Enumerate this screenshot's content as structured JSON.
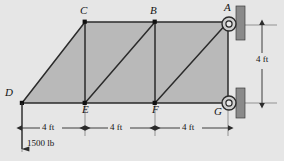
{
  "figure": {
    "colors": {
      "background": "#e6e6e6",
      "member_fill": "#b9b9b9",
      "member_line": "#2b2b2b",
      "support_plate": "#8a8a8a",
      "dimension_line": "#4a4a4a",
      "text": "#141414"
    }
  },
  "nodes": [
    {
      "id": "C",
      "label": "C",
      "x": 85,
      "y": 22,
      "label_x": 80,
      "label_y": 6
    },
    {
      "id": "B",
      "label": "B",
      "x": 155,
      "y": 22,
      "label_x": 150,
      "label_y": 6
    },
    {
      "id": "A",
      "label": "A",
      "x": 228,
      "y": 22,
      "label_x": 223,
      "label_y": 4
    },
    {
      "id": "D",
      "label": "D",
      "x": 22,
      "y": 103,
      "label_x": 6,
      "label_y": 88
    },
    {
      "id": "E",
      "label": "E",
      "x": 85,
      "y": 103,
      "label_x": 82,
      "label_y": 105
    },
    {
      "id": "F",
      "label": "F",
      "x": 155,
      "y": 103,
      "label_x": 152,
      "label_y": 105
    },
    {
      "id": "G",
      "label": "G",
      "x": 228,
      "y": 103,
      "label_x": 215,
      "label_y": 107
    }
  ],
  "members": [
    {
      "from": "D",
      "to": "C",
      "type": "diagonal"
    },
    {
      "from": "C",
      "to": "B",
      "type": "top-chord"
    },
    {
      "from": "B",
      "to": "A",
      "type": "top-chord"
    },
    {
      "from": "D",
      "to": "E",
      "type": "bottom-chord"
    },
    {
      "from": "E",
      "to": "F",
      "type": "bottom-chord"
    },
    {
      "from": "F",
      "to": "G",
      "type": "bottom-chord"
    },
    {
      "from": "C",
      "to": "E",
      "type": "vertical"
    },
    {
      "from": "B",
      "to": "F",
      "type": "vertical"
    },
    {
      "from": "A",
      "to": "G",
      "type": "vertical"
    },
    {
      "from": "E",
      "to": "B",
      "type": "diagonal"
    },
    {
      "from": "F",
      "to": "A",
      "type": "diagonal"
    }
  ],
  "supports": [
    {
      "at": "A",
      "kind": "pin-roller-on-wall",
      "plate_x": 236,
      "plate_y": 6,
      "plate_w": 9,
      "plate_h": 34
    },
    {
      "at": "G",
      "kind": "roller-on-wall",
      "plate_x": 236,
      "plate_y": 88,
      "plate_w": 9,
      "plate_h": 30
    }
  ],
  "dimensions": {
    "horizontal": [
      {
        "label": "4 ft",
        "from_x": 22,
        "to_x": 85,
        "y": 128,
        "label_x": 42,
        "label_y": 121
      },
      {
        "label": "4 ft",
        "from_x": 85,
        "to_x": 155,
        "y": 128,
        "label_x": 110,
        "label_y": 121
      },
      {
        "label": "4 ft",
        "from_x": 155,
        "to_x": 228,
        "y": 128,
        "label_x": 182,
        "label_y": 121
      }
    ],
    "vertical": [
      {
        "label": "4 ft",
        "x": 262,
        "from_y": 25,
        "to_y": 103,
        "label_x": 264,
        "label_y": 58
      }
    ]
  },
  "load": {
    "label": "1500 lb",
    "magnitude": "1500",
    "unit": "lb",
    "applied_at": "D",
    "direction": "down",
    "arrow_x": 22,
    "arrow_from_y": 103,
    "arrow_to_y": 149,
    "label_x": 27,
    "label_y": 144
  }
}
